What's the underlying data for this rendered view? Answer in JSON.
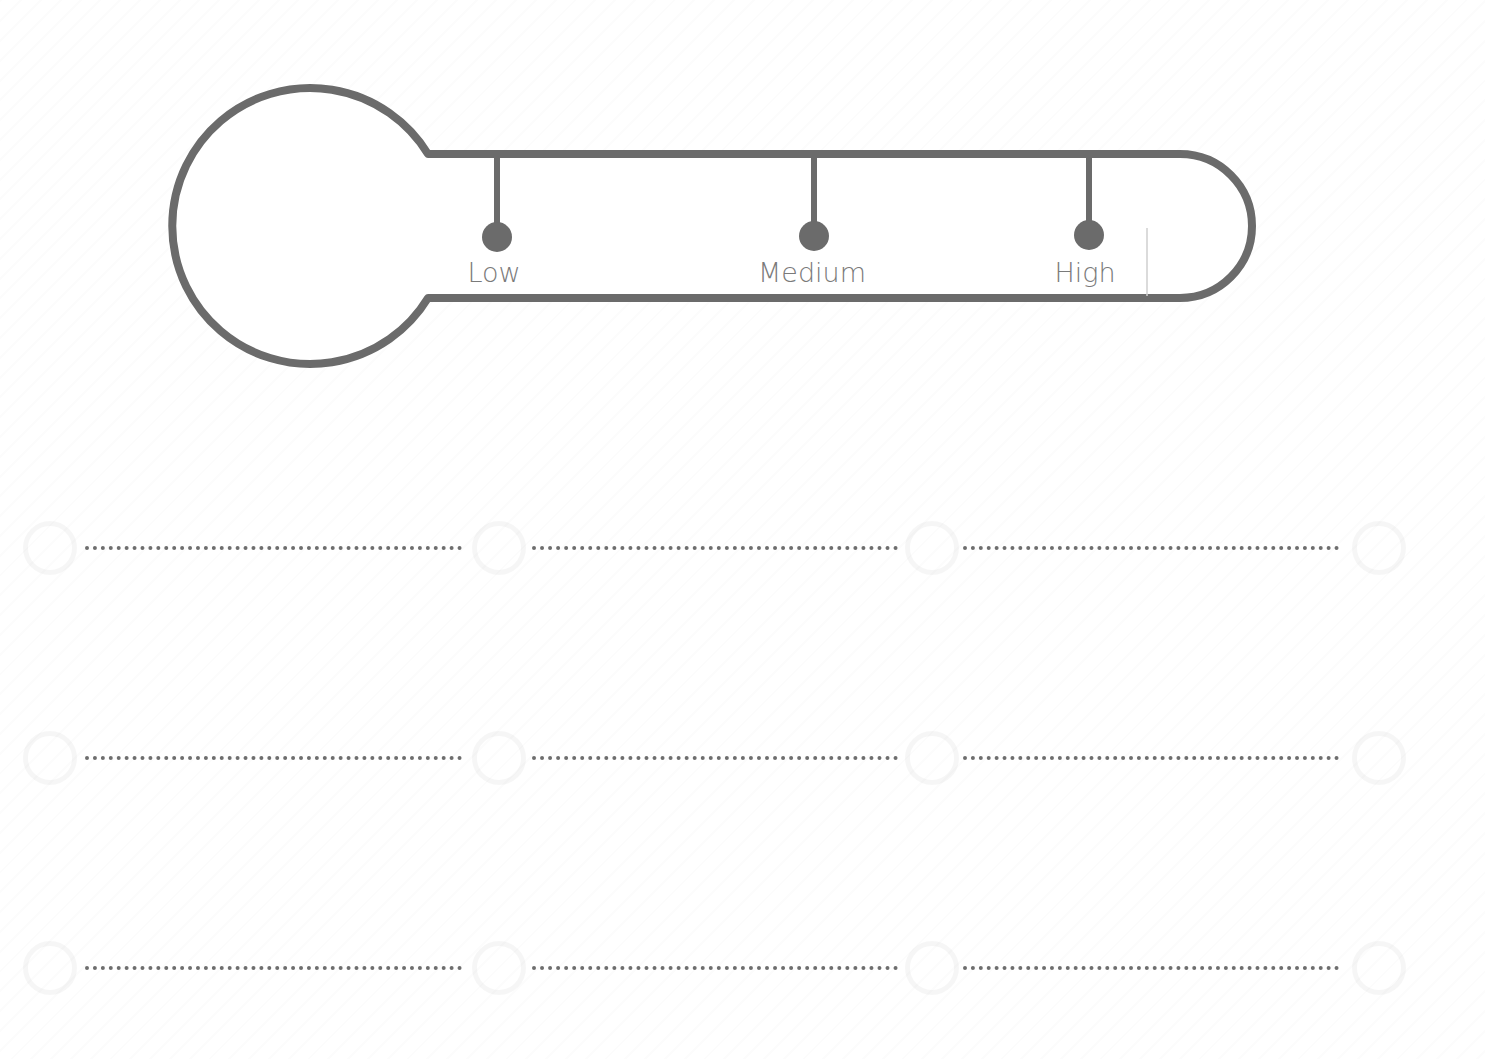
{
  "thermometer": {
    "stroke_color": "#6b6b6b",
    "label_color": "#7a7a7a",
    "ticks": [
      {
        "label": "Low",
        "x": 497
      },
      {
        "label": "Medium",
        "x": 814
      },
      {
        "label": "High",
        "x": 1089
      }
    ]
  },
  "answer_lines": {
    "rows": 3,
    "columns_per_row": 3,
    "dot_color": "#6e6e6e",
    "values": [
      [
        "",
        "",
        ""
      ],
      [
        "",
        "",
        ""
      ],
      [
        "",
        "",
        ""
      ]
    ]
  }
}
